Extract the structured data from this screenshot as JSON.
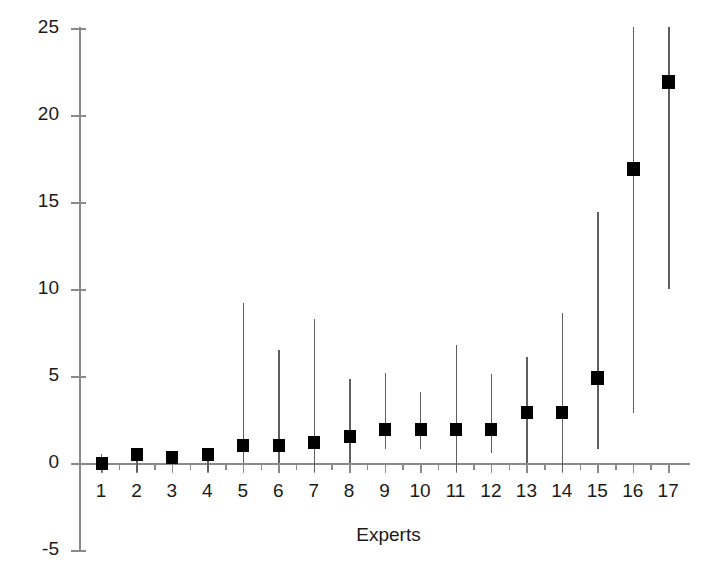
{
  "chart_data": {
    "type": "scatter",
    "title": "",
    "xlabel": "Experts",
    "ylabel": "Loss of gross world product (%)",
    "categories": [
      "1",
      "2",
      "3",
      "4",
      "5",
      "6",
      "7",
      "8",
      "9",
      "10",
      "11",
      "12",
      "13",
      "14",
      "15",
      "16",
      "17"
    ],
    "x": [
      1,
      2,
      3,
      4,
      5,
      6,
      7,
      8,
      9,
      10,
      11,
      12,
      13,
      14,
      15,
      16,
      17
    ],
    "values": [
      0.0,
      0.5,
      0.3,
      0.5,
      1.0,
      1.0,
      1.2,
      1.5,
      1.9,
      1.9,
      1.9,
      1.9,
      2.9,
      2.9,
      4.9,
      16.9,
      21.9
    ],
    "error_low": [
      -0.5,
      -0.5,
      0.0,
      -0.5,
      0.0,
      0.0,
      -0.5,
      0.0,
      0.8,
      0.8,
      -0.5,
      0.6,
      0.0,
      -0.5,
      0.8,
      2.9,
      10.0
    ],
    "error_high": [
      0.5,
      0.8,
      0.6,
      0.8,
      9.2,
      6.5,
      8.3,
      4.8,
      5.2,
      4.1,
      6.8,
      5.1,
      6.1,
      8.6,
      14.4,
      25.3,
      25.3
    ],
    "ylim": [
      -5,
      25
    ],
    "xlim": [
      0.3,
      17.7
    ],
    "yticks": [
      -5,
      0,
      5,
      10,
      15,
      20,
      25
    ],
    "ytick_labels": [
      "-5",
      "0",
      "5",
      "10",
      "15",
      "20",
      "25"
    ],
    "grid": false,
    "legend": null,
    "marker": "filled-square",
    "series_name": "Expert estimate with range",
    "colors": {
      "marker": "#000000",
      "axis": "#8a8a8a",
      "error_bar": "#5f5f5f",
      "text": "#1a1a1a",
      "background": "#ffffff"
    }
  }
}
